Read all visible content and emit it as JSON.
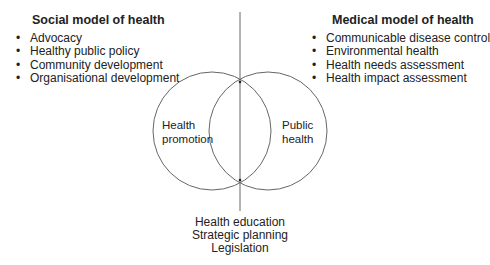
{
  "social_model": {
    "title": "Social model of health",
    "items": [
      "Advocacy",
      "Healthy public policy",
      "Community development",
      "Organisational development"
    ]
  },
  "medical_model": {
    "title": "Medical model of health",
    "items": [
      "Communicable disease control",
      "Environmental health",
      "Health needs assessment",
      "Health impact assessment"
    ]
  },
  "venn": {
    "left_label": [
      "Health",
      "promotion"
    ],
    "right_label": [
      "Public",
      "health"
    ]
  },
  "overlap_items": [
    "Health education",
    "Strategic planning",
    "Legislation"
  ],
  "colors": {
    "line": "#555555",
    "text": "#222222"
  }
}
